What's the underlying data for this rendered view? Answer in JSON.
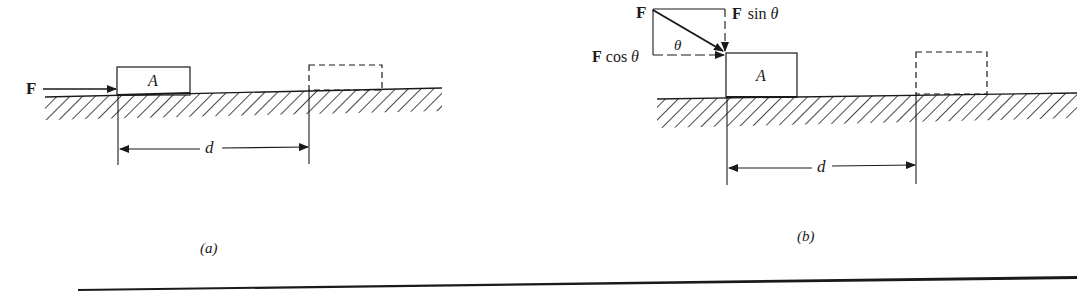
{
  "figure": {
    "panel_a": {
      "caption": "(a)",
      "force_label": "F",
      "block_label": "A",
      "distance_label": "d"
    },
    "panel_b": {
      "caption": "(b)",
      "force_label": "F",
      "force_vertical_label": "F sin θ",
      "force_horizontal_label": "F cos θ",
      "angle_label": "θ",
      "block_label": "A",
      "distance_label": "d"
    },
    "colors": {
      "ink": "#1a1a1a",
      "background": "#ffffff"
    }
  }
}
